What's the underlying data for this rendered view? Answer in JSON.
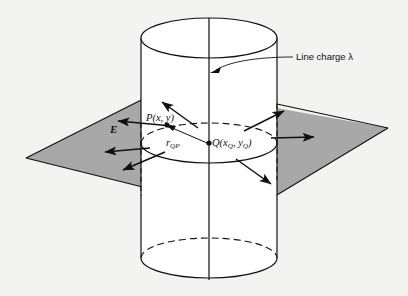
{
  "figure": {
    "background_color": "#f3f3f1",
    "ink_color": "#101010",
    "plane_fill_color": "#a8a8a8",
    "cylinder_fill_color": "#ffffff"
  },
  "labels": {
    "line_charge": "Line charge λ",
    "point_p": "P(x, y)",
    "point_q_prefix": "Q(x",
    "point_q_sub1": "Q",
    "point_q_mid": ", y",
    "point_q_sub2": "Q",
    "point_q_suffix": ")",
    "distance_prefix": "r",
    "distance_sub": "QP",
    "field_vector": "E"
  },
  "geometry": {
    "cylinder": {
      "axis_x": 209,
      "axis_top_y": 18,
      "axis_bottom_y": 280,
      "radius_x": 68,
      "radius_y": 20,
      "top_center_y": 38,
      "bottom_center_y": 258,
      "mid_center_y": 143,
      "left_wall_x": 141,
      "right_wall_x": 277
    },
    "plane_corners": {
      "left": [
        26,
        158
      ],
      "top": [
        165,
        88
      ],
      "right": [
        388,
        128
      ],
      "bottom": [
        247,
        213
      ]
    },
    "point_p": [
      167,
      125
    ],
    "point_q": [
      209,
      143
    ]
  },
  "field_arrows": [
    {
      "name": "arrow-up-left",
      "x1": 198,
      "y1": 128,
      "x2": 161,
      "y2": 101
    },
    {
      "name": "arrow-left",
      "x1": 172,
      "y1": 126,
      "x2": 117,
      "y2": 121
    },
    {
      "name": "arrow-lower-left",
      "x1": 165,
      "y1": 152,
      "x2": 122,
      "y2": 171
    },
    {
      "name": "arrow-left-mid",
      "x1": 150,
      "y1": 148,
      "x2": 104,
      "y2": 152
    },
    {
      "name": "arrow-up-right",
      "x1": 244,
      "y1": 131,
      "x2": 285,
      "y2": 110
    },
    {
      "name": "arrow-right",
      "x1": 271,
      "y1": 138,
      "x2": 315,
      "y2": 137
    },
    {
      "name": "arrow-lower-right",
      "x1": 236,
      "y1": 159,
      "x2": 272,
      "y2": 185
    }
  ]
}
